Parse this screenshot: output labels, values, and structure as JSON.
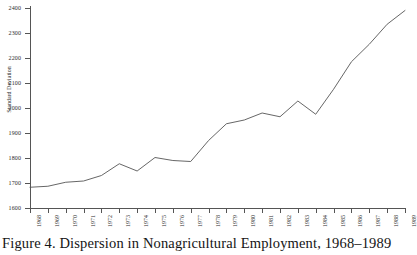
{
  "figure": {
    "caption": "Figure 4.  Dispersion in Nonagricultural Employment, 1968–1989"
  },
  "chart_data": {
    "type": "line",
    "title": "",
    "xlabel": "",
    "ylabel": "Standard Deviation",
    "categories": [
      "1968",
      "1969",
      "1970",
      "1971",
      "1972",
      "1973",
      "1974",
      "1975",
      "1976",
      "1977",
      "1978",
      "1979",
      "1980",
      "1981",
      "1982",
      "1983",
      "1984",
      "1985",
      "1986",
      "1987",
      "1988",
      "1989"
    ],
    "values": [
      1683,
      1687,
      1703,
      1708,
      1730,
      1777,
      1748,
      1802,
      1790,
      1786,
      1870,
      1937,
      1952,
      1980,
      1965,
      2028,
      1975,
      2075,
      2185,
      2255,
      2335,
      2390
    ],
    "series": [
      {
        "name": "Standard Deviation",
        "values": [
          1683,
          1687,
          1703,
          1708,
          1730,
          1777,
          1748,
          1802,
          1790,
          1786,
          1870,
          1937,
          1952,
          1980,
          1965,
          2028,
          1975,
          2075,
          2185,
          2255,
          2335,
          2390
        ]
      }
    ],
    "ylim": [
      1600,
      2400
    ],
    "yticks": [
      1600,
      1700,
      1800,
      1900,
      2000,
      2100,
      2200,
      2300,
      2400
    ],
    "xlim": [
      "1968",
      "1989"
    ],
    "grid": false,
    "legend": false,
    "line_color": "#555555"
  },
  "axes": {
    "y_title": "Standard Deviation",
    "y_tick_labels": [
      "2400",
      "2300",
      "2200",
      "2100",
      "2000",
      "1900",
      "1800",
      "1700",
      "1600"
    ],
    "x_tick_labels": [
      "1968",
      "1969",
      "1970",
      "1971",
      "1972",
      "1973",
      "1974",
      "1975",
      "1976",
      "1977",
      "1978",
      "1979",
      "1980",
      "1981",
      "1982",
      "1983",
      "1984",
      "1985",
      "1986",
      "1987",
      "1988",
      "1989"
    ]
  }
}
